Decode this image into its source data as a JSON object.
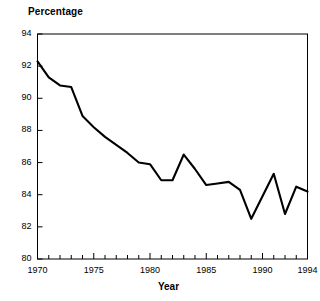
{
  "chart_data": {
    "type": "line",
    "title": "",
    "ylabel": "Percentage",
    "xlabel": "Year",
    "xlim": [
      1970,
      1994
    ],
    "ylim": [
      80,
      94
    ],
    "ytick_step": 2,
    "xtick_step": 1,
    "grid": false,
    "legend": null,
    "line_color": "#000000",
    "axis_color": "#000000",
    "background": "#ffffff",
    "ytick_labels": [
      "94",
      "92",
      "90",
      "88",
      "86",
      "84",
      "82",
      "80"
    ],
    "ytick_values": [
      94,
      92,
      90,
      88,
      86,
      84,
      82,
      80
    ],
    "xtick_labels": [
      "1970",
      "1975",
      "1980",
      "1985",
      "1990",
      "1994"
    ],
    "xtick_label_values": [
      1970,
      1975,
      1980,
      1985,
      1990,
      1994
    ],
    "x": [
      1970,
      1971,
      1972,
      1973,
      1974,
      1975,
      1976,
      1977,
      1978,
      1979,
      1980,
      1981,
      1982,
      1983,
      1984,
      1985,
      1986,
      1987,
      1988,
      1989,
      1990,
      1991,
      1992,
      1993,
      1994
    ],
    "values": [
      92.3,
      91.3,
      90.8,
      90.7,
      88.9,
      88.2,
      87.6,
      87.1,
      86.6,
      86.0,
      85.9,
      84.9,
      84.9,
      86.5,
      85.6,
      84.6,
      84.7,
      84.8,
      84.3,
      82.5,
      83.9,
      85.3,
      82.8,
      84.5,
      84.2
    ],
    "series_name": "Percentage"
  },
  "axes": {
    "y_axis_label": "Percentage",
    "x_axis_label": "Year"
  }
}
